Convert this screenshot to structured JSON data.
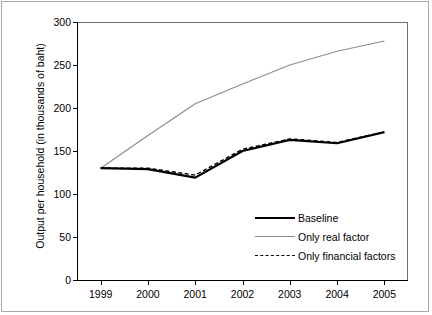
{
  "chart_data": {
    "type": "line",
    "title": "",
    "xlabel": "",
    "ylabel": "Output per household (in thousands of baht)",
    "categories": [
      "1999",
      "2000",
      "2001",
      "2002",
      "2003",
      "2004",
      "2005"
    ],
    "ylim": [
      0,
      300
    ],
    "yticks": [
      0,
      50,
      100,
      150,
      200,
      250,
      300
    ],
    "ytick_labels": [
      "0",
      "50",
      "100",
      "150",
      "200",
      "250",
      "300"
    ],
    "grid": false,
    "legend_position": "inside-lower-right",
    "series": [
      {
        "name": "Baseline",
        "style": "solid",
        "color": "#000000",
        "width": 2.2,
        "values": [
          130,
          129,
          119,
          150,
          163,
          159,
          172
        ]
      },
      {
        "name": "Only real factor",
        "style": "solid",
        "color": "#8c8c8c",
        "width": 1.1,
        "values": [
          130,
          168,
          205,
          228,
          250,
          266,
          278
        ]
      },
      {
        "name": "Only financial factors",
        "style": "dashed",
        "color": "#000000",
        "width": 1.4,
        "values": [
          130,
          130,
          122,
          152,
          164,
          160,
          172
        ]
      }
    ]
  },
  "axis": {
    "y_title": "Output per household (in thousands of baht)"
  },
  "legend": {
    "items": [
      {
        "label": "Baseline"
      },
      {
        "label": "Only real factor"
      },
      {
        "label": "Only financial factors"
      }
    ]
  }
}
